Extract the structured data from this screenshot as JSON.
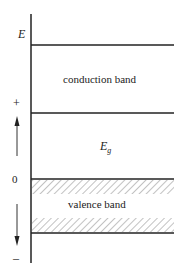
{
  "diagram": {
    "axis_label": "E",
    "plus_label": "+",
    "zero_label": "0",
    "minus_label": "–",
    "conduction_band_label": "conduction band",
    "gap_label_main": "E",
    "gap_label_sub": "g",
    "valence_band_label": "valence band",
    "line_color": "#222222",
    "hatch_color": "#555555"
  }
}
